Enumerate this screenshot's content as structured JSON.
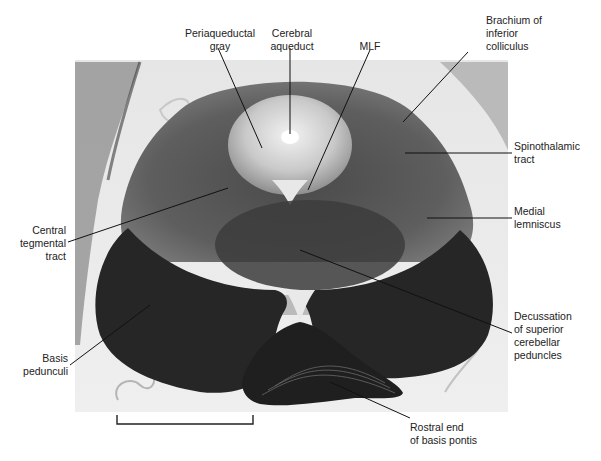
{
  "figure": {
    "labels": {
      "periaqueductal_gray": [
        "Periaqueductal",
        "gray"
      ],
      "cerebral_aqueduct": [
        "Cerebral",
        "aqueduct"
      ],
      "mlf": [
        "MLF"
      ],
      "brachium": [
        "Brachium of",
        "inferior",
        "colliculus"
      ],
      "spinothalamic": [
        "Spinothalamic",
        "tract"
      ],
      "medial_lemniscus": [
        "Medial",
        "lemniscus"
      ],
      "central_tegmental": [
        "Central",
        "tegmental",
        "tract"
      ],
      "decussation": [
        "Decussation",
        "of superior",
        "cerebellar",
        "peduncles"
      ],
      "basis_pedunculi": [
        "Basis",
        "pedunculi"
      ],
      "rostral_pontis": [
        "Rostral end",
        "of basis pontis"
      ]
    },
    "scale_bar": {
      "visible": true
    },
    "colors": {
      "background": "#ffffff",
      "tissue_dark": "#2a2a2a",
      "tissue_mid": "#6b6b6b",
      "tissue_light": "#cfcfcf",
      "leader_line": "#111111"
    }
  }
}
